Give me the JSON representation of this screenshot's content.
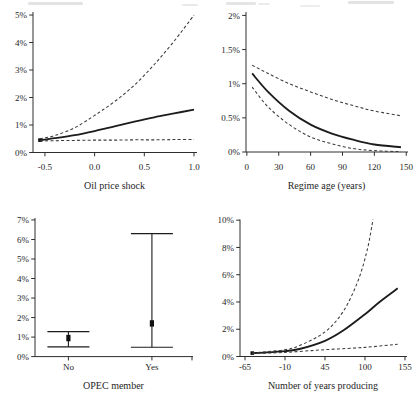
{
  "colors": {
    "background": "#ffffff",
    "axis": "#2e2e2e",
    "text": "#262626",
    "solid_line": "#1c1c1c",
    "dashed_line": "#3a3a3a",
    "marker": "#111111"
  },
  "chart_data": [
    {
      "id": "oil-price-shock",
      "type": "line",
      "title": "",
      "xlabel": "Oil price shock",
      "ylabel": "",
      "xlim": [
        -0.62,
        1.02
      ],
      "ylim": [
        0,
        5.11
      ],
      "grid": false,
      "legend": "none",
      "xticks": {
        "values": [
          -0.5,
          0,
          0.5,
          1
        ],
        "labels": [
          "-0.5",
          "0.0",
          "0.5",
          "1.0"
        ]
      },
      "yticks": {
        "values": [
          0,
          1,
          2,
          3,
          4,
          5
        ],
        "labels": [
          "0%",
          "1%",
          "2%",
          "3%",
          "4%",
          "5%"
        ]
      },
      "series": [
        {
          "name": "point-estimate",
          "style": "solid",
          "start_marker": true,
          "x": [
            -0.55,
            -0.4,
            -0.2,
            0,
            0.2,
            0.4,
            0.6,
            0.8,
            1
          ],
          "y": [
            0.45,
            0.52,
            0.63,
            0.78,
            0.95,
            1.12,
            1.28,
            1.42,
            1.56
          ]
        },
        {
          "name": "upper-95ci",
          "style": "dashed",
          "x": [
            -0.55,
            -0.4,
            -0.2,
            0,
            0.2,
            0.4,
            0.6,
            0.8,
            1
          ],
          "y": [
            0.5,
            0.62,
            0.9,
            1.35,
            1.85,
            2.45,
            3.2,
            4.05,
            5.0
          ]
        },
        {
          "name": "lower-95ci",
          "style": "dashed",
          "x": [
            -0.55,
            -0.4,
            -0.2,
            0,
            0.2,
            0.4,
            0.6,
            0.8,
            1
          ],
          "y": [
            0.42,
            0.43,
            0.44,
            0.45,
            0.45,
            0.46,
            0.46,
            0.47,
            0.47
          ]
        }
      ]
    },
    {
      "id": "regime-age",
      "type": "line",
      "title": "",
      "xlabel": "Regime age (years)",
      "ylabel": "",
      "xlim": [
        -0.8,
        150.7
      ],
      "ylim": [
        0,
        2.05
      ],
      "grid": false,
      "legend": "none",
      "xticks": {
        "values": [
          0,
          30,
          60,
          90,
          120,
          150
        ],
        "labels": [
          "0",
          "30",
          "60",
          "90",
          "120",
          "150"
        ]
      },
      "yticks": {
        "values": [
          0,
          0.5,
          1,
          1.5,
          2
        ],
        "labels": [
          "0%",
          "0.5%",
          "1%",
          "1.5%",
          "2%"
        ]
      },
      "series": [
        {
          "name": "point-estimate",
          "style": "solid",
          "x": [
            5,
            20,
            40,
            60,
            80,
            100,
            120,
            145
          ],
          "y": [
            1.15,
            0.88,
            0.6,
            0.4,
            0.27,
            0.18,
            0.11,
            0.07
          ]
        },
        {
          "name": "upper-95ci",
          "style": "dashed",
          "x": [
            5,
            20,
            40,
            60,
            80,
            100,
            120,
            145
          ],
          "y": [
            1.27,
            1.15,
            1.0,
            0.88,
            0.77,
            0.68,
            0.6,
            0.53
          ]
        },
        {
          "name": "lower-95ci",
          "style": "dashed",
          "x": [
            5,
            20,
            40,
            60,
            80,
            100,
            120,
            145
          ],
          "y": [
            0.95,
            0.66,
            0.4,
            0.22,
            0.12,
            0.05,
            0.02,
            0.005
          ]
        }
      ]
    },
    {
      "id": "opec-member",
      "type": "errorbar",
      "title": "",
      "xlabel": "OPEC member",
      "ylabel": "",
      "xlim": [
        0.6,
        2.48
      ],
      "ylim": [
        0,
        7.1
      ],
      "grid": false,
      "legend": "none",
      "end_tick": true,
      "categories": [
        "No",
        "Yes"
      ],
      "xticks": {
        "values": [
          1,
          2
        ],
        "labels": [
          "No",
          "Yes"
        ]
      },
      "yticks": {
        "values": [
          0,
          1,
          2,
          3,
          4,
          5,
          6,
          7
        ],
        "labels": [
          "0%",
          "1%",
          "2%",
          "3%",
          "4%",
          "5%",
          "6%",
          "7%"
        ]
      },
      "points": [
        {
          "category": "No",
          "x": 1,
          "estimate": 0.95,
          "low": 0.5,
          "high": 1.28
        },
        {
          "category": "Yes",
          "x": 2,
          "estimate": 1.7,
          "low": 0.48,
          "high": 6.3
        }
      ]
    },
    {
      "id": "number-of-years-producing",
      "type": "line",
      "title": "",
      "xlabel": "Number of years producing",
      "ylabel": "",
      "xlim": [
        -71.9,
        156.4
      ],
      "ylim": [
        0,
        10.05
      ],
      "grid": false,
      "legend": "none",
      "xticks": {
        "values": [
          -65,
          -10,
          45,
          100,
          155
        ],
        "labels": [
          "-65",
          "-10",
          "45",
          "100",
          "155"
        ]
      },
      "yticks": {
        "values": [
          0,
          2,
          4,
          6,
          8,
          10
        ],
        "labels": [
          "0%",
          "2%",
          "4%",
          "6%",
          "8%",
          "10%"
        ]
      },
      "series": [
        {
          "name": "point-estimate",
          "style": "solid",
          "start_marker": true,
          "x": [
            -55,
            -35,
            -10,
            10,
            45,
            70,
            100,
            120,
            145
          ],
          "y": [
            0.25,
            0.3,
            0.4,
            0.55,
            1.15,
            1.9,
            3.1,
            4.0,
            5.0
          ]
        },
        {
          "name": "upper-95ci",
          "style": "dashed",
          "x": [
            -55,
            -35,
            -10,
            10,
            45,
            70,
            90,
            103,
            111
          ],
          "y": [
            0.27,
            0.36,
            0.5,
            0.8,
            1.8,
            3.3,
            5.5,
            7.8,
            10.05
          ]
        },
        {
          "name": "lower-95ci",
          "style": "dashed",
          "x": [
            -55,
            -10,
            45,
            100,
            145
          ],
          "y": [
            0.22,
            0.3,
            0.5,
            0.67,
            0.9
          ]
        }
      ]
    }
  ]
}
